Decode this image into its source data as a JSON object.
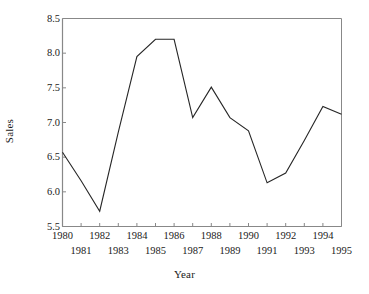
{
  "chart_data": {
    "type": "line",
    "title": "",
    "xlabel": "Year",
    "ylabel": "Sales",
    "x": [
      1980,
      1981,
      1982,
      1983,
      1984,
      1985,
      1986,
      1987,
      1988,
      1989,
      1990,
      1991,
      1992,
      1993,
      1994,
      1995
    ],
    "values": [
      6.57,
      6.16,
      5.72,
      6.86,
      7.95,
      8.2,
      8.2,
      7.07,
      7.51,
      7.07,
      6.88,
      6.13,
      6.27,
      6.74,
      7.23,
      7.12
    ],
    "series": [
      {
        "name": "Sales",
        "values": [
          6.57,
          6.16,
          5.72,
          6.86,
          7.95,
          8.2,
          8.2,
          7.07,
          7.51,
          7.07,
          6.88,
          6.13,
          6.27,
          6.74,
          7.23,
          7.12
        ]
      }
    ],
    "xlim": [
      1980,
      1995
    ],
    "ylim": [
      5.5,
      8.5
    ],
    "xticks": [
      1980,
      1981,
      1982,
      1983,
      1984,
      1985,
      1986,
      1987,
      1988,
      1989,
      1990,
      1991,
      1992,
      1993,
      1994,
      1995
    ],
    "xticklabels": [
      "1980",
      "1981",
      "1982",
      "1983",
      "1984",
      "1985",
      "1986",
      "1987",
      "1988",
      "1989",
      "1990",
      "1991",
      "1992",
      "1993",
      "1994",
      "1995"
    ],
    "xtick_stagger": "even-years-top-row-odd-years-bottom-row",
    "yticks": [
      5.5,
      6.0,
      6.5,
      7.0,
      7.5,
      8.0,
      8.5
    ],
    "yticklabels": [
      "5.5",
      "6.0",
      "6.5",
      "7.0",
      "7.5",
      "8.0",
      "8.5"
    ],
    "grid": false,
    "legend": false,
    "line_color": "#262626",
    "axis_color": "#888888",
    "background_color": "#ffffff"
  }
}
